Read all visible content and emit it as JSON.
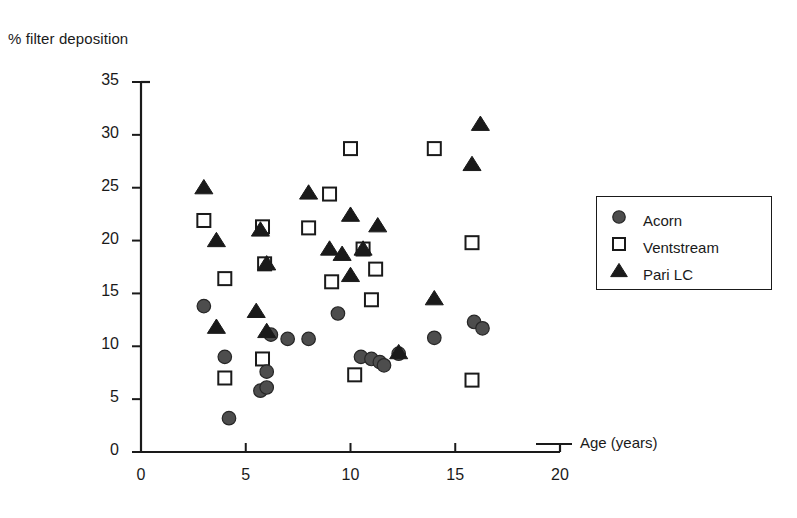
{
  "chart_data": {
    "type": "scatter",
    "title": "",
    "xlabel": "Age (years)",
    "ylabel": "% filter deposition",
    "xlim": [
      0,
      20
    ],
    "ylim": [
      0,
      35
    ],
    "xticks": [
      0,
      5,
      10,
      15,
      20
    ],
    "yticks": [
      0,
      5,
      10,
      15,
      20,
      25,
      30,
      35
    ],
    "grid": false,
    "legend_position": "right",
    "series": [
      {
        "name": "Acorn",
        "marker": "filled-circle",
        "color": "#4d4d4d",
        "points": [
          [
            3.0,
            13.8
          ],
          [
            4.0,
            9.0
          ],
          [
            4.2,
            3.2
          ],
          [
            5.7,
            5.8
          ],
          [
            6.0,
            6.1
          ],
          [
            6.0,
            7.6
          ],
          [
            6.2,
            11.1
          ],
          [
            7.0,
            10.7
          ],
          [
            8.0,
            10.7
          ],
          [
            9.4,
            13.1
          ],
          [
            10.5,
            9.0
          ],
          [
            11.0,
            8.8
          ],
          [
            11.4,
            8.5
          ],
          [
            11.6,
            8.2
          ],
          [
            12.3,
            9.3
          ],
          [
            14.0,
            10.8
          ],
          [
            15.9,
            12.3
          ],
          [
            16.3,
            11.7
          ]
        ]
      },
      {
        "name": "Ventstream",
        "marker": "open-square",
        "color": "#1a1a1a",
        "points": [
          [
            3.0,
            21.9
          ],
          [
            4.0,
            16.4
          ],
          [
            4.0,
            7.0
          ],
          [
            5.8,
            21.3
          ],
          [
            5.9,
            17.8
          ],
          [
            5.8,
            8.8
          ],
          [
            8.0,
            21.2
          ],
          [
            9.0,
            24.4
          ],
          [
            9.1,
            16.1
          ],
          [
            10.0,
            28.7
          ],
          [
            10.6,
            19.2
          ],
          [
            10.2,
            7.3
          ],
          [
            11.2,
            17.3
          ],
          [
            11.0,
            14.4
          ],
          [
            14.0,
            28.7
          ],
          [
            15.8,
            19.8
          ],
          [
            15.8,
            6.8
          ]
        ]
      },
      {
        "name": "Pari LC",
        "marker": "filled-triangle",
        "color": "#1a1a1a",
        "points": [
          [
            3.0,
            25.0
          ],
          [
            3.6,
            20.0
          ],
          [
            3.6,
            11.8
          ],
          [
            5.5,
            13.3
          ],
          [
            5.7,
            21.0
          ],
          [
            6.0,
            17.8
          ],
          [
            6.0,
            11.4
          ],
          [
            8.0,
            24.5
          ],
          [
            9.0,
            19.2
          ],
          [
            9.6,
            18.7
          ],
          [
            10.0,
            22.4
          ],
          [
            10.6,
            19.2
          ],
          [
            10.0,
            16.7
          ],
          [
            11.3,
            21.4
          ],
          [
            14.0,
            14.5
          ],
          [
            15.8,
            27.2
          ],
          [
            16.2,
            31.0
          ],
          [
            12.3,
            9.4
          ]
        ]
      }
    ]
  },
  "legend": {
    "items": [
      {
        "label": "Acorn",
        "marker": "filled-circle"
      },
      {
        "label": "Ventstream",
        "marker": "open-square"
      },
      {
        "label": "Pari LC",
        "marker": "filled-triangle"
      }
    ]
  }
}
